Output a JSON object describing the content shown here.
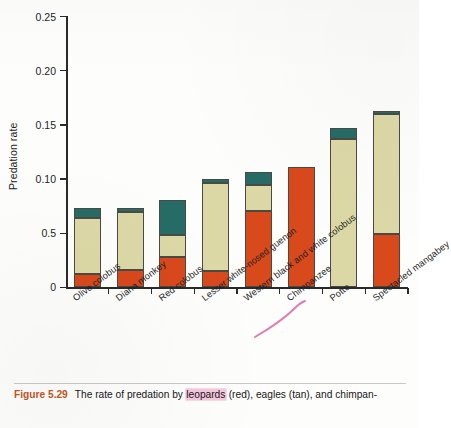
{
  "figure": {
    "label": "Figure 5.29",
    "caption_before": "The rate of predation by ",
    "caption_highlight": "leopards",
    "caption_after": " (red), eagles (tan), and chimpan-"
  },
  "axes": {
    "y_title": "Predation rate",
    "y_ticks": [
      "0.25",
      "0.20",
      "0.15",
      "0.10",
      "0.5",
      "0"
    ]
  },
  "annotations": {
    "chimpanzee_underline_color": "#e27ab4",
    "leopards_highlight_color": "#f6c6dd"
  },
  "chart_data": {
    "type": "bar",
    "title": "",
    "xlabel": "",
    "ylabel": "Predation rate",
    "ylim": [
      0,
      0.25
    ],
    "ytick_values": [
      0.25,
      0.2,
      0.15,
      0.1,
      0.05,
      0
    ],
    "ytick_labels": [
      "0.25",
      "0.20",
      "0.15",
      "0.10",
      "0.5",
      "0"
    ],
    "grid": false,
    "legend_position": "none",
    "stacked": true,
    "categories": [
      "Olive colobus",
      "Diana monkey",
      "Red colobus",
      "Lesser white-nosed guenon",
      "Western black and white colobus",
      "Chimpanzee",
      "Potto",
      "Spectacled mangabey"
    ],
    "series": [
      {
        "name": "leopards",
        "color": "#d8491c",
        "values": [
          0.012,
          0.016,
          0.028,
          0.015,
          0.071,
          0.111,
          0.0,
          0.049
        ]
      },
      {
        "name": "eagles",
        "color": "#dcd8a6",
        "values": [
          0.052,
          0.054,
          0.02,
          0.081,
          0.024,
          0.0,
          0.137,
          0.111
        ]
      },
      {
        "name": "chimpanzees",
        "color": "#266b66",
        "values": [
          0.009,
          0.003,
          0.033,
          0.004,
          0.012,
          0.0,
          0.01,
          0.003
        ]
      }
    ],
    "totals": [
      0.073,
      0.073,
      0.081,
      0.1,
      0.107,
      0.111,
      0.147,
      0.163
    ]
  }
}
